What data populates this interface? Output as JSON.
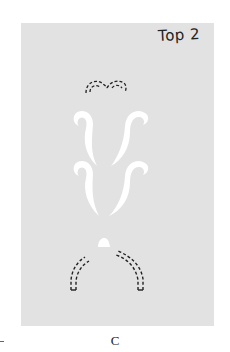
{
  "figure": {
    "panel_label": "Top 2",
    "caption": "C",
    "colors": {
      "panel": "#e2e2e2",
      "cutout": "#ffffff",
      "dashed_line": "#222222"
    },
    "elements": [
      {
        "name": "top-dashed-double-arch",
        "style": "dashed"
      },
      {
        "name": "upper-left-scroll-cutout",
        "style": "solid-white"
      },
      {
        "name": "upper-right-scroll-cutout",
        "style": "solid-white"
      },
      {
        "name": "lower-left-scroll-cutout",
        "style": "solid-white"
      },
      {
        "name": "lower-right-scroll-cutout",
        "style": "solid-white"
      },
      {
        "name": "small-dome-cutout",
        "style": "solid-white"
      },
      {
        "name": "bottom-left-dashed-arc",
        "style": "dashed"
      },
      {
        "name": "bottom-right-dashed-arc",
        "style": "dashed"
      }
    ]
  }
}
